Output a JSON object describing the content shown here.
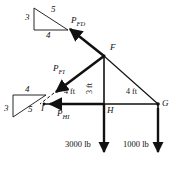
{
  "figure": {
    "type": "free-body-diagram",
    "ink_color": "#111111",
    "background": "#ffffff"
  },
  "joints": [
    {
      "name": "F",
      "label": "F",
      "x": 104,
      "y": 56
    },
    {
      "name": "G",
      "label": "G",
      "x": 158,
      "y": 104
    },
    {
      "name": "H",
      "label": "H",
      "x": 104,
      "y": 104
    },
    {
      "name": "I",
      "label": "I",
      "x": 44,
      "y": 104
    }
  ],
  "forces": [
    {
      "name": "P-FD",
      "base": "P",
      "sub": "FD",
      "label": "P",
      "subscript": "FD",
      "direction": "up-left"
    },
    {
      "name": "P-FI",
      "base": "P",
      "sub": "FI",
      "label": "P",
      "subscript": "FI",
      "direction": "down-left"
    },
    {
      "name": "P-HI",
      "base": "P",
      "sub": "HI",
      "label": "P",
      "subscript": "HI",
      "direction": "left"
    }
  ],
  "dimensions": [
    {
      "name": "dim-fh",
      "value": "3 ft",
      "orientation": "vertical",
      "member": "F-H"
    },
    {
      "name": "dim-ih",
      "value": "4 ft",
      "orientation": "horizontal",
      "member": "I-H"
    },
    {
      "name": "dim-hg",
      "value": "4 ft",
      "orientation": "horizontal",
      "member": "H-G"
    }
  ],
  "loads": [
    {
      "name": "load-at-H",
      "value": "3000 lb",
      "direction": "down"
    },
    {
      "name": "load-at-G",
      "value": "1000 lb",
      "direction": "down"
    }
  ],
  "slope_triangles": [
    {
      "name": "slope-triangle-upper",
      "vertical": "3",
      "horizontal": "4",
      "hypotenuse": "5",
      "associated_force": "P_FD"
    },
    {
      "name": "slope-triangle-lower",
      "vertical": "3",
      "horizontal": "4",
      "hypotenuse": "5",
      "associated_force": "P_FI"
    }
  ]
}
